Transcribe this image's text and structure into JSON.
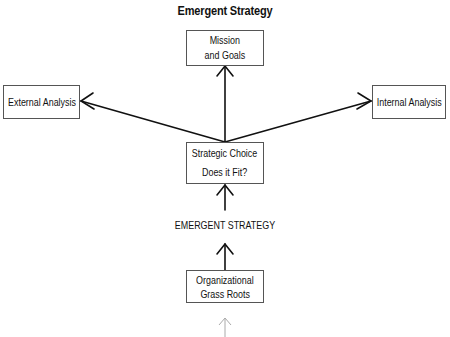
{
  "title": "Emergent Strategy",
  "nodes": {
    "mission": {
      "lines": [
        "Mission",
        "and Goals"
      ]
    },
    "external": {
      "lines": [
        "External Analysis"
      ]
    },
    "internal": {
      "lines": [
        "Internal Analysis"
      ]
    },
    "choice": {
      "lines": [
        "Strategic Choice",
        "Does it Fit?"
      ]
    },
    "grass_roots": {
      "lines": [
        "Organizational",
        "Grass Roots"
      ]
    }
  },
  "edge_label": "EMERGENT STRATEGY",
  "edges": [
    {
      "from": "choice",
      "to": "mission"
    },
    {
      "from": "choice",
      "to": "external"
    },
    {
      "from": "choice",
      "to": "internal"
    },
    {
      "from": "emergent_strategy",
      "to": "choice"
    },
    {
      "from": "grass_roots",
      "to": "emergent_strategy"
    },
    {
      "from": "below",
      "to": "grass_roots",
      "style": "faint"
    }
  ],
  "colors": {
    "line": "#111111",
    "faint": "#aaaaaa",
    "border": "#555555"
  }
}
